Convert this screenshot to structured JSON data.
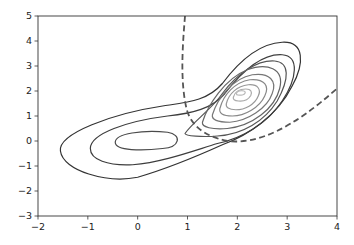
{
  "chart_data": {
    "type": "contour",
    "title": "",
    "xlabel": "",
    "ylabel": "",
    "xlim": [
      -2,
      4
    ],
    "ylim": [
      -3,
      5
    ],
    "grid": false,
    "legend": null,
    "xticks": [
      "−2",
      "−1",
      "0",
      "1",
      "2",
      "3",
      "4"
    ],
    "yticks": [
      "−3",
      "−2",
      "−1",
      "0",
      "1",
      "2",
      "3",
      "4",
      "5"
    ],
    "xtick_values": [
      -2,
      -1,
      0,
      1,
      2,
      3,
      4
    ],
    "ytick_values": [
      -3,
      -2,
      -1,
      0,
      1,
      2,
      3,
      4,
      5
    ],
    "modes": [
      {
        "center": [
          0.3,
          0.0
        ],
        "note": "broad mode"
      },
      {
        "center": [
          2.0,
          2.0
        ],
        "note": "tight correlated mode"
      }
    ],
    "contours": [
      {
        "level": 1,
        "color": "#333333",
        "path": "M -1.55 -0.4 C -1.6 0.3, -0.5 1.1, 0.5 1.4 C 1.0 1.55, 1.4 1.6, 1.7 2.3 C 2.0 3.1, 2.4 3.9, 2.9 3.95 C 3.35 4.0, 3.35 3.1, 3.1 2.2 C 2.8 1.0, 2.2 0.2, 1.7 -0.15 C 1.2 -0.6, 0.6 -1.1, 0.0 -1.45 C -0.6 -1.7, -1.5 -1.2, -1.55 -0.4 Z"
      },
      {
        "level": 2,
        "color": "#3d3d3d",
        "path": "M -0.95 -0.3 C -0.95 0.3, -0.2 0.8, 0.6 1.0 C 1.1 1.1, 1.5 1.3, 1.75 1.9 C 2.1 2.8, 2.5 3.5, 2.9 3.45 C 3.25 3.4, 3.2 2.5, 2.9 1.6 C 2.6 0.7, 2.1 0.1, 1.6 -0.1 C 1.1 -0.4, 0.5 -0.85, -0.1 -0.95 C -0.6 -1.0, -0.95 -0.75, -0.95 -0.3 Z"
      },
      {
        "level": 3,
        "color": "#4a4a4a",
        "path": "M -0.45 -0.05 C -0.45 0.3, 0.1 0.45, 0.6 0.35 C 0.9 0.25, 0.85 -0.25, 0.5 -0.3 C 0.1 -0.4, -0.45 -0.4, -0.45 -0.05 Z"
      },
      {
        "level": 3,
        "color": "#555555",
        "path": "M 0.95 0.3 C 1.1 0.75, 1.5 1.3, 1.7 1.9 C 2.0 2.7, 2.4 3.25, 2.75 3.2 C 3.05 3.15, 3.05 2.5, 2.8 1.6 C 2.55 0.8, 2.1 0.25, 1.6 0.2 C 1.3 0.15, 0.95 0.2, 0.95 0.3 Z"
      },
      {
        "level": 4,
        "color": "#666666",
        "path": "M 1.3 0.75 C 1.4 1.4, 1.75 2.5, 2.2 2.85 C 2.6 3.15, 2.95 2.9, 2.85 2.1 C 2.75 1.3, 2.3 0.6, 1.8 0.5 C 1.5 0.45, 1.28 0.55, 1.3 0.75 Z"
      },
      {
        "level": 5,
        "color": "#777777",
        "path": "M 1.5 1.05 C 1.6 1.7, 1.9 2.5, 2.3 2.65 C 2.65 2.75, 2.8 2.4, 2.7 1.9 C 2.6 1.3, 2.2 0.8, 1.85 0.75 C 1.6 0.75, 1.48 0.85, 1.5 1.05 Z"
      },
      {
        "level": 6,
        "color": "#888888",
        "path": "M 1.65 1.3 C 1.72 1.85, 1.95 2.35, 2.25 2.45 C 2.55 2.5, 2.65 2.2, 2.55 1.8 C 2.45 1.35, 2.15 1.0, 1.9 1.0 C 1.7 1.0, 1.63 1.12, 1.65 1.3 Z"
      },
      {
        "level": 7,
        "color": "#999999",
        "path": "M 1.78 1.5 C 1.83 1.9, 2.0 2.2, 2.22 2.25 C 2.42 2.28, 2.48 2.05, 2.42 1.8 C 2.35 1.45, 2.15 1.25, 1.97 1.25 C 1.83 1.25, 1.76 1.35, 1.78 1.5 Z"
      },
      {
        "level": 8,
        "color": "#aaaaaa",
        "path": "M 1.92 1.75 C 1.95 1.98, 2.05 2.08, 2.17 2.08 C 2.28 2.08, 2.3 1.95, 2.27 1.82 C 2.22 1.65, 2.12 1.58, 2.02 1.6 C 1.94 1.62, 1.91 1.67, 1.92 1.75 Z"
      },
      {
        "level": 9,
        "color": "#bbbbbb",
        "path": "M 1.98 1.9 C 2.0 2.0, 2.08 2.03, 2.13 2.0 C 2.18 1.97, 2.16 1.87, 2.1 1.84 C 2.04 1.82, 1.97 1.84, 1.98 1.9 Z"
      }
    ],
    "decision_boundary": {
      "style": "dashed",
      "color": "#555555",
      "path": "M 0.95 5.0 C 0.9 3.8, 0.85 2.4, 0.98 1.3 C 1.05 0.7, 1.3 0.2, 1.8 0.0 C 2.4 -0.15, 3.1 0.5, 4.0 2.1"
    }
  }
}
